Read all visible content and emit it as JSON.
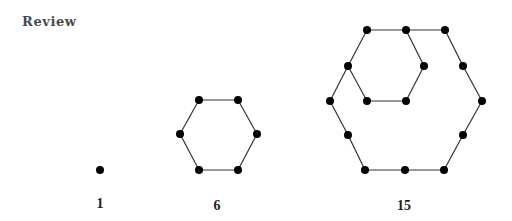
{
  "heading": "Review",
  "figures": [
    {
      "label": "1",
      "label_pos": [
        100,
        196
      ],
      "points": [
        [
          100,
          170
        ]
      ],
      "edges": []
    },
    {
      "label": "6",
      "label_pos": [
        217,
        198
      ],
      "points": [
        [
          199,
          100
        ],
        [
          238,
          100
        ],
        [
          257,
          134
        ],
        [
          238,
          170
        ],
        [
          199,
          170
        ],
        [
          180,
          134
        ]
      ],
      "edges": [
        [
          0,
          1
        ],
        [
          1,
          2
        ],
        [
          2,
          3
        ],
        [
          3,
          4
        ],
        [
          4,
          5
        ],
        [
          5,
          0
        ]
      ]
    },
    {
      "label": "15",
      "label_pos": [
        404,
        198
      ],
      "points": [
        [
          367,
          30
        ],
        [
          406,
          30
        ],
        [
          445,
          30
        ],
        [
          348,
          66
        ],
        [
          424,
          66
        ],
        [
          463,
          66
        ],
        [
          330,
          101
        ],
        [
          367,
          101
        ],
        [
          406,
          101
        ],
        [
          482,
          101
        ],
        [
          348,
          135
        ],
        [
          463,
          135
        ],
        [
          365,
          170
        ],
        [
          405,
          170
        ],
        [
          444,
          170
        ]
      ],
      "edges": [
        [
          0,
          1
        ],
        [
          1,
          2
        ],
        [
          0,
          3
        ],
        [
          3,
          6
        ],
        [
          1,
          4
        ],
        [
          4,
          8
        ],
        [
          8,
          7
        ],
        [
          7,
          3
        ],
        [
          2,
          5
        ],
        [
          5,
          9
        ],
        [
          9,
          11
        ],
        [
          11,
          14
        ],
        [
          14,
          13
        ],
        [
          13,
          12
        ],
        [
          12,
          10
        ],
        [
          10,
          6
        ]
      ]
    }
  ],
  "style": {
    "dot_color": "#000000",
    "line_color": "#333333",
    "dot_radius": 4
  }
}
